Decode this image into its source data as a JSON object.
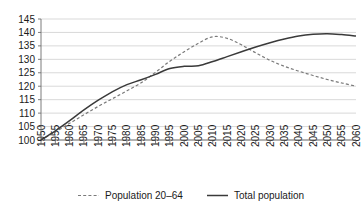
{
  "chart_data": {
    "type": "line",
    "title": "",
    "subtitle": "",
    "xlabel": "",
    "ylabel": "",
    "grid": true,
    "legend_position": "bottom",
    "xlim": [
      1950,
      2060
    ],
    "ylim": [
      100,
      145
    ],
    "ytick_step": 5,
    "xtick_step": 5,
    "x": [
      1950,
      1955,
      1960,
      1965,
      1970,
      1975,
      1980,
      1985,
      1990,
      1995,
      2000,
      2005,
      2010,
      2015,
      2020,
      2025,
      2030,
      2035,
      2040,
      2045,
      2050,
      2055,
      2060
    ],
    "xticklabels": [
      "1950",
      "1955",
      "1960",
      "1965",
      "1970",
      "1975",
      "1980",
      "1985",
      "1990",
      "1995",
      "2000",
      "2005",
      "2010",
      "2015",
      "2020",
      "2025",
      "2030",
      "2035",
      "2040",
      "2045",
      "2050",
      "2055",
      "2060"
    ],
    "yticklabels": [
      "100",
      "105",
      "110",
      "115",
      "120",
      "125",
      "130",
      "135",
      "140",
      "145"
    ],
    "series": [
      {
        "name": "Population 20–64",
        "style": "dashed",
        "color": "#7a7a7a",
        "values": [
          100.0,
          103.0,
          106.2,
          109.4,
          112.5,
          115.4,
          118.3,
          121.3,
          125.2,
          129.3,
          132.8,
          136.0,
          138.4,
          137.8,
          135.4,
          132.4,
          129.6,
          127.4,
          125.6,
          124.0,
          122.5,
          121.2,
          120.0
        ]
      },
      {
        "name": "Total population",
        "style": "solid",
        "color": "#3a3a3a",
        "values": [
          100.0,
          103.4,
          107.2,
          111.2,
          114.8,
          118.0,
          120.6,
          122.4,
          124.4,
          126.6,
          127.4,
          127.6,
          129.2,
          131.0,
          132.8,
          134.6,
          136.2,
          137.6,
          138.7,
          139.3,
          139.5,
          139.2,
          138.7
        ]
      }
    ]
  },
  "legend": {
    "items": [
      {
        "label": "Population 20–64",
        "style": "dashed"
      },
      {
        "label": "Total population",
        "style": "solid"
      }
    ]
  }
}
